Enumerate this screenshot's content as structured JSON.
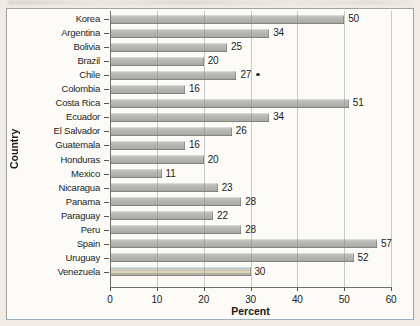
{
  "chart_data": {
    "type": "bar",
    "orientation": "horizontal",
    "title": "",
    "categories": [
      "Korea",
      "Argentina",
      "Bolivia",
      "Brazil",
      "Chile",
      "Colombia",
      "Costa Rica",
      "Ecuador",
      "El Salvador",
      "Guatemala",
      "Honduras",
      "Mexico",
      "Nicaragua",
      "Panama",
      "Paraguay",
      "Peru",
      "Spain",
      "Uruguay",
      "Venezuela"
    ],
    "values": [
      50,
      34,
      25,
      20,
      27,
      16,
      51,
      34,
      26,
      16,
      20,
      11,
      23,
      28,
      22,
      28,
      57,
      52,
      30
    ],
    "xlabel": "Percent",
    "ylabel": "Country",
    "xlim": [
      0,
      60
    ],
    "xticks": [
      0,
      10,
      20,
      30,
      40,
      50,
      60
    ],
    "grid": true,
    "legend": "none",
    "bar_color": "#b4b4b0",
    "data_labels": true,
    "annotations": [
      {
        "category": "Chile",
        "marker": "dot"
      }
    ]
  }
}
